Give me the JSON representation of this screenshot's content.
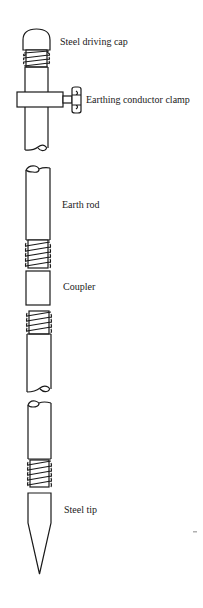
{
  "diagram": {
    "labels": {
      "cap": "Steel driving cap",
      "clamp": "Earthing conductor clamp",
      "rod": "Earth rod",
      "coupler": "Coupler",
      "tip": "Steel tip"
    },
    "colors": {
      "line": "#1a1a1a",
      "background": "#ffffff"
    }
  }
}
